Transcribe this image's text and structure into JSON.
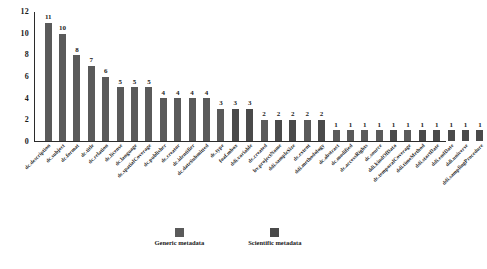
{
  "chart_data": {
    "type": "bar",
    "title": "",
    "xlabel": "",
    "ylabel": "",
    "ylim": [
      0,
      12
    ],
    "yticks": [
      0,
      2,
      4,
      6,
      8,
      10,
      12
    ],
    "grid": false,
    "legend_position": "bottom",
    "categories": [
      "dc.description",
      "dc.subject",
      "dc.format",
      "dc.title",
      "dc.relation",
      "dc.license",
      "dc.language",
      "dc.spatialCoverage",
      "dc.publisher",
      "dc.creator",
      "dc.identifier",
      "dc.dateSubmitted",
      "dc.type",
      "foaf.mbox",
      "ddi.variable",
      "dc.created",
      "bv.projectName",
      "ddi.sampleSize",
      "dc.extent",
      "ddi.methodology",
      "dc.abstract",
      "dc.modified",
      "dc.accessRights",
      "dc.source",
      "ddi.kindOfData",
      "dc.temporalCoverage",
      "ddi.timeMethod",
      "ddi.startDate",
      "ddi.endDate",
      "ddi.universe",
      "ddi.samplingProcedure"
    ],
    "values": [
      11,
      10,
      8,
      7,
      6,
      5,
      5,
      5,
      4,
      4,
      4,
      4,
      3,
      3,
      3,
      2,
      2,
      2,
      2,
      2,
      1,
      1,
      1,
      1,
      1,
      1,
      1,
      1,
      1,
      1,
      1
    ],
    "series_kind": [
      "generic",
      "generic",
      "generic",
      "generic",
      "generic",
      "generic",
      "generic",
      "generic",
      "generic",
      "generic",
      "generic",
      "generic",
      "generic",
      "scientific",
      "scientific",
      "generic",
      "scientific",
      "scientific",
      "generic",
      "scientific",
      "generic",
      "generic",
      "generic",
      "generic",
      "scientific",
      "generic",
      "scientific",
      "scientific",
      "scientific",
      "scientific",
      "scientific"
    ],
    "legend": [
      {
        "label": "Generic metadata",
        "color": "#5a5a5a",
        "kind": "generic"
      },
      {
        "label": "Scientific metadata",
        "color": "#4a4a4a",
        "kind": "scientific"
      }
    ],
    "colors": {
      "generic": "#5a5a5a",
      "scientific": "#4a4a4a",
      "axis": "#2b2b2b",
      "text": "#1a1a1a",
      "background": "#ffffff"
    }
  }
}
